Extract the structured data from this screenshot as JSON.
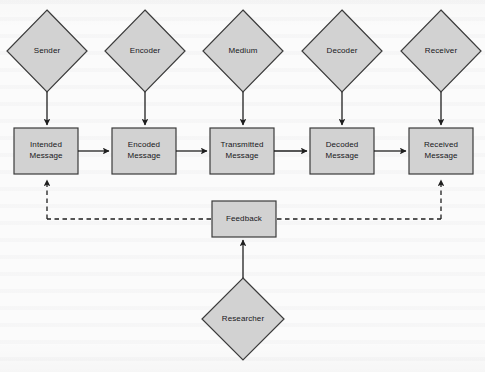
{
  "figure": {
    "type": "process-flow-diagram",
    "canvas": {
      "width": 485,
      "height": 372
    },
    "colors": {
      "node_fill": "#d2d2d2",
      "node_stroke": "#3b3b3b",
      "connector": "#1f1f1f",
      "background": "#fbfbfb",
      "label_text": "#17171a"
    }
  },
  "nodes": {
    "diamonds": [
      {
        "id": "sender",
        "label": "Sender",
        "cx": 47,
        "cy": 51,
        "rx": 40,
        "ry": 41
      },
      {
        "id": "encoder",
        "label": "Encoder",
        "cx": 145,
        "cy": 51,
        "rx": 40,
        "ry": 41
      },
      {
        "id": "medium",
        "label": "Medium",
        "cx": 243,
        "cy": 51,
        "rx": 40,
        "ry": 41
      },
      {
        "id": "decoder",
        "label": "Decoder",
        "cx": 342,
        "cy": 51,
        "rx": 40,
        "ry": 41
      },
      {
        "id": "receiver",
        "label": "Receiver",
        "cx": 441,
        "cy": 51,
        "rx": 40,
        "ry": 41
      },
      {
        "id": "researcher",
        "label": "Researcher",
        "cx": 243,
        "cy": 319,
        "rx": 41,
        "ry": 41
      }
    ],
    "boxes": [
      {
        "id": "intended-message",
        "line1": "Intended",
        "line2": "Message",
        "x": 14,
        "y": 128,
        "w": 64,
        "h": 46
      },
      {
        "id": "encoded-message",
        "line1": "Encoded",
        "line2": "Message",
        "x": 112,
        "y": 128,
        "w": 64,
        "h": 46
      },
      {
        "id": "transmitted-message",
        "line1": "Transmitted",
        "line2": "Message",
        "x": 210,
        "y": 128,
        "w": 64,
        "h": 46
      },
      {
        "id": "decoded-message",
        "line1": "Decoded",
        "line2": "Message",
        "x": 310,
        "y": 128,
        "w": 64,
        "h": 46
      },
      {
        "id": "received-message",
        "line1": "Received",
        "line2": "Message",
        "x": 409,
        "y": 128,
        "w": 64,
        "h": 46
      },
      {
        "id": "feedback",
        "line1": "Feedback",
        "line2": "",
        "x": 212,
        "y": 201,
        "w": 64,
        "h": 36
      }
    ]
  },
  "connectors": [
    {
      "id": "sender-to-intended",
      "style": "solid",
      "from": "sender",
      "to": "intended-message"
    },
    {
      "id": "encoder-to-encoded",
      "style": "solid",
      "from": "encoder",
      "to": "encoded-message"
    },
    {
      "id": "medium-to-transmitted",
      "style": "solid",
      "from": "medium",
      "to": "transmitted-message"
    },
    {
      "id": "decoder-to-decoded",
      "style": "solid",
      "from": "decoder",
      "to": "decoded-message"
    },
    {
      "id": "receiver-to-received",
      "style": "solid",
      "from": "receiver",
      "to": "received-message"
    },
    {
      "id": "intended-to-encoded",
      "style": "solid",
      "from": "intended-message",
      "to": "encoded-message"
    },
    {
      "id": "encoded-to-transmitted",
      "style": "solid",
      "from": "encoded-message",
      "to": "transmitted-message"
    },
    {
      "id": "transmitted-to-decoded",
      "style": "solid",
      "from": "transmitted-message",
      "to": "decoded-message"
    },
    {
      "id": "decoded-to-received",
      "style": "solid",
      "from": "decoded-message",
      "to": "received-message"
    },
    {
      "id": "researcher-to-feedback",
      "style": "solid",
      "from": "researcher",
      "to": "feedback"
    },
    {
      "id": "feedback-to-intended",
      "style": "dashed",
      "from": "feedback",
      "to": "intended-message"
    },
    {
      "id": "received-to-feedback",
      "style": "dashed",
      "from": "received-message",
      "to": "feedback"
    }
  ]
}
